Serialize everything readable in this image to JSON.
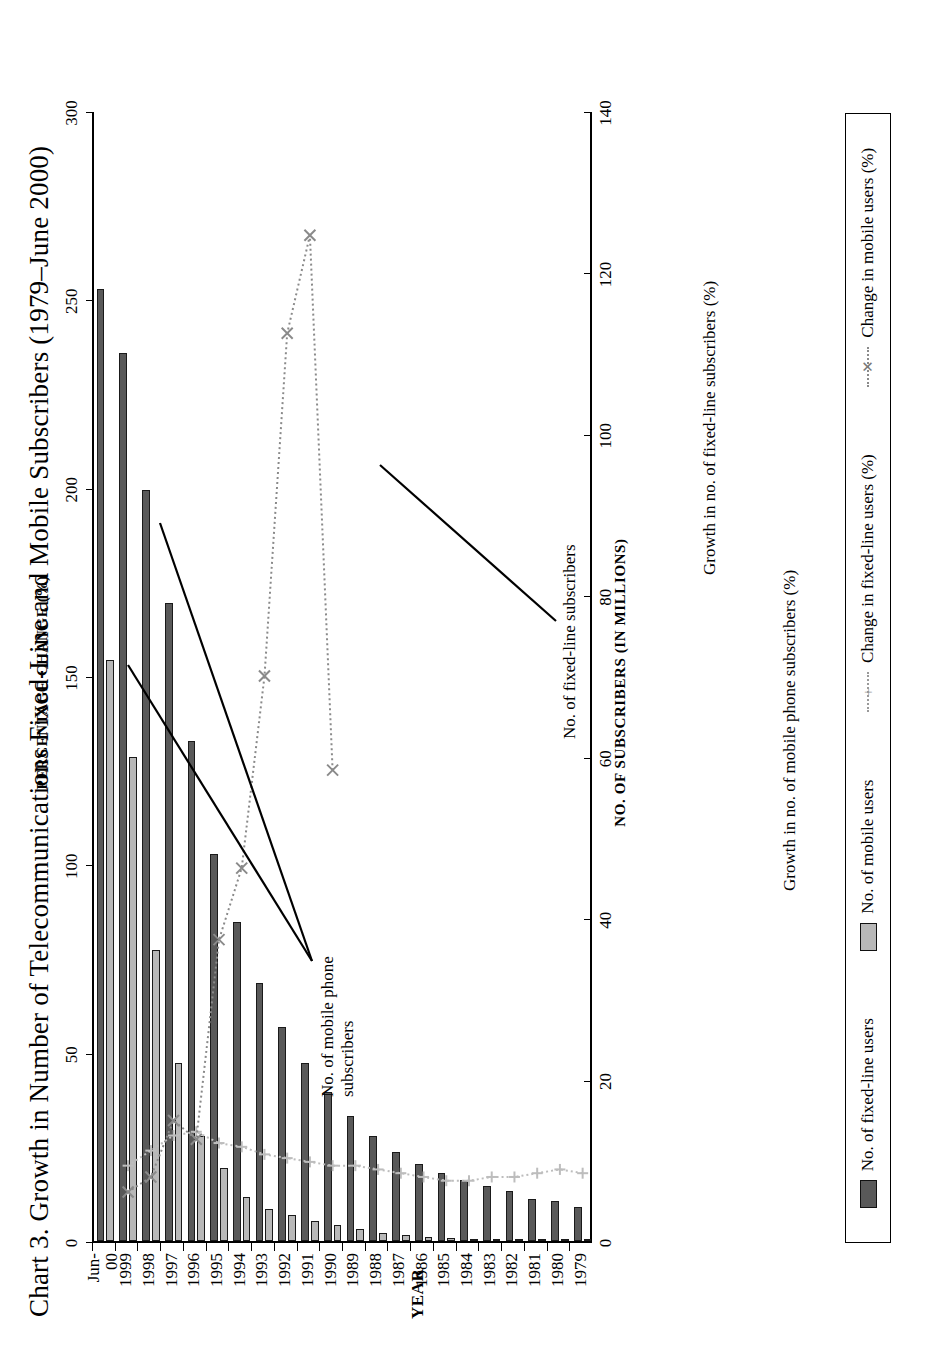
{
  "title": "Chart 3.  Growth in Number of Telecommunications Fixed-Line and Mobile Subscribers (1979–June 2000)",
  "axes": {
    "year_title": "YEAR",
    "subscribers_title": "NO. OF SUBSCRIBERS (IN MILLIONS)",
    "percent_title": "PERCENTAGE CHANGE (%)",
    "subscriber_ticks": [
      "0",
      "20",
      "40",
      "60",
      "80",
      "100",
      "120",
      "140"
    ],
    "percent_ticks": [
      "0",
      "50",
      "100",
      "150",
      "200",
      "250",
      "300"
    ]
  },
  "legend": {
    "items": [
      {
        "label": "No. of fixed-line users",
        "kind": "bar",
        "color": "#595959"
      },
      {
        "label": "No. of mobile users",
        "kind": "bar",
        "color": "#b8b8b8"
      },
      {
        "label": "Change in fixed-line users (%)",
        "kind": "line",
        "color": "#bdbdbd"
      },
      {
        "label": "Change in mobile users (%)",
        "kind": "line",
        "color": "#8a8a8a"
      }
    ]
  },
  "annotations": [
    {
      "id": "anno-mobile-subscribers",
      "text": "No. of mobile phone\nsubscribers"
    },
    {
      "id": "anno-fixed-subscribers",
      "text": "No. of fixed-line subscribers"
    },
    {
      "id": "anno-mobile-growth",
      "text": "Growth in no. of mobile phone subscribers (%)"
    },
    {
      "id": "anno-fixed-growth",
      "text": "Growth in no. of fixed-line subscribers (%)"
    }
  ],
  "chart_data": {
    "type": "bar",
    "title": "Chart 3.  Growth in Number of Telecommunications Fixed-Line and Mobile Subscribers (1979–June 2000)",
    "xlabel": "YEAR",
    "ylabel": "NO. OF SUBSCRIBERS (IN MILLIONS)",
    "y2label": "PERCENTAGE CHANGE (%)",
    "ylim": [
      0,
      140
    ],
    "y2lim": [
      0,
      300
    ],
    "grid": false,
    "legend_position": "bottom",
    "orientation": "horizontal-bars (page printed rotated 90°)",
    "categories": [
      "1979",
      "1980",
      "1981",
      "1982",
      "1983",
      "1984",
      "1985",
      "1986",
      "1987",
      "1988",
      "1989",
      "1990",
      "1991",
      "1992",
      "1993",
      "1994",
      "1995",
      "1996",
      "1997",
      "1998",
      "1999",
      "Jun-00"
    ],
    "series": [
      {
        "name": "No. of fixed-line users",
        "axis": "left",
        "units": "millions",
        "type": "bar",
        "color": "#595959",
        "values": [
          4.2,
          5.0,
          5.2,
          6.2,
          6.8,
          7.6,
          8.4,
          9.5,
          11.0,
          13.0,
          15.5,
          18.5,
          22.0,
          26.5,
          32.0,
          39.5,
          48.0,
          62.0,
          79.0,
          93.0,
          110.0,
          118.0
        ]
      },
      {
        "name": "No. of mobile users",
        "axis": "left",
        "units": "millions",
        "type": "bar",
        "color": "#b8b8b8",
        "values": [
          0.0,
          0.0,
          0.05,
          0.1,
          0.2,
          0.3,
          0.4,
          0.5,
          0.7,
          1.0,
          1.5,
          2.0,
          2.5,
          3.2,
          4.0,
          5.5,
          9.0,
          13.0,
          22.0,
          36.0,
          60.0,
          72.0
        ]
      },
      {
        "name": "Change in fixed-line users (%)",
        "axis": "right",
        "units": "percent",
        "type": "line",
        "color": "#bdbdbd",
        "marker": "plus",
        "values": [
          18,
          19,
          18,
          17,
          17,
          16,
          16,
          17,
          18,
          19,
          20,
          20,
          21,
          22,
          23,
          25,
          26,
          29,
          28,
          24,
          20,
          null
        ]
      },
      {
        "name": "Change in mobile users (%)",
        "axis": "right",
        "units": "percent",
        "type": "line",
        "color": "#8a8a8a",
        "marker": "x",
        "values": [
          null,
          null,
          null,
          null,
          null,
          null,
          null,
          null,
          null,
          null,
          null,
          125,
          267,
          241,
          150,
          99,
          80,
          27,
          32,
          17,
          13,
          null
        ]
      }
    ]
  }
}
